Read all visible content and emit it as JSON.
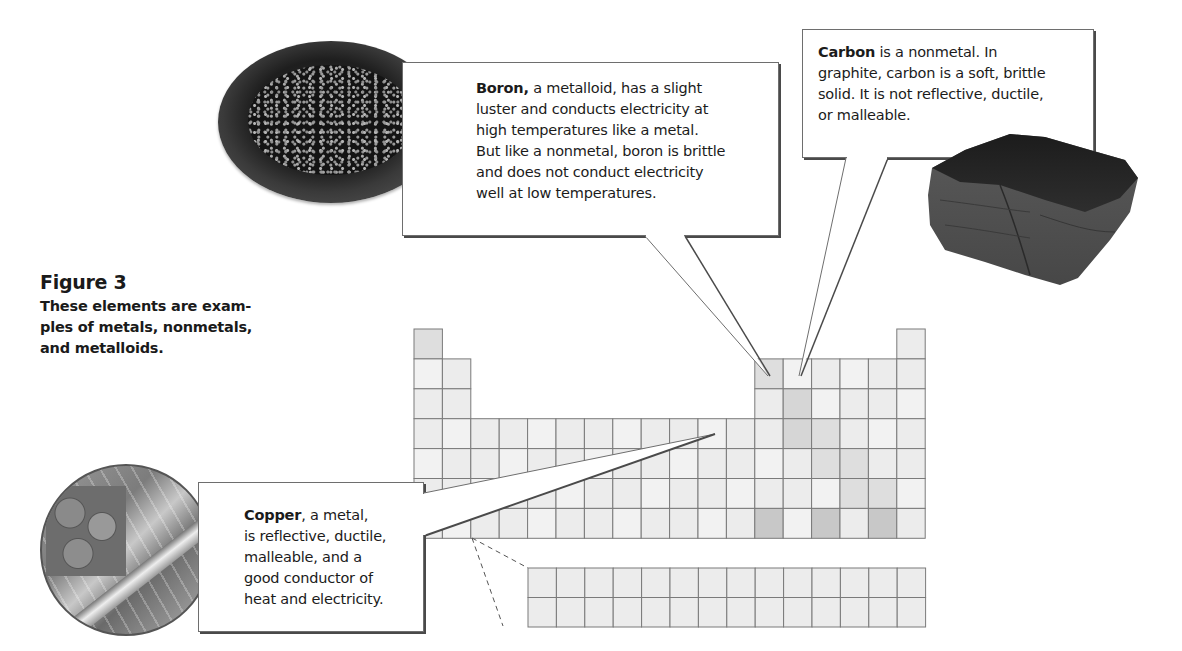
{
  "figure": {
    "title": "Figure 3",
    "caption": "These elements are examples of metals, nonmetals, and metalloids.",
    "caption_lines": [
      "These elements are exam-",
      "ples of metals,  nonmetals,",
      "and metalloids."
    ]
  },
  "callouts": {
    "boron": {
      "bold": "Boron,",
      "lines": [
        " a metalloid,  has a slight",
        "luster and conducts electricity at",
        "high temperatures like a metal.",
        "But like a nonmetal, boron is brittle",
        "and does not conduct electricity",
        "well at low temperatures."
      ],
      "image": "boron-sample-dish"
    },
    "carbon": {
      "bold": "Carbon",
      "lines": [
        " is a nonmetal.  In",
        "graphite, carbon is a soft, brittle",
        "solid.  It is not reflective, ductile,",
        "or malleable."
      ],
      "image": "graphite-chunk"
    },
    "copper": {
      "bold": "Copper",
      "lines": [
        ", a metal,",
        "is reflective, ductile,",
        "malleable, and a",
        "good conductor of",
        "heat and electricity."
      ],
      "image": "copper-coins-and-wire"
    }
  },
  "periodic_table": {
    "main_rows": 7,
    "columns": 18,
    "f_block_rows": 2,
    "f_block_columns": 14,
    "colors": {
      "border": "#7a7a7a",
      "metal": "#ececec",
      "light": "#f2f2f2",
      "metalloid": "#dedede",
      "nonmetal_shade": "#d6d6d6",
      "dark": "#c8c8c8"
    },
    "highlighted": {
      "boron": {
        "row": 2,
        "col": 13
      },
      "carbon": {
        "row": 2,
        "col": 14
      },
      "copper": {
        "row": 4,
        "col": 11
      }
    }
  }
}
